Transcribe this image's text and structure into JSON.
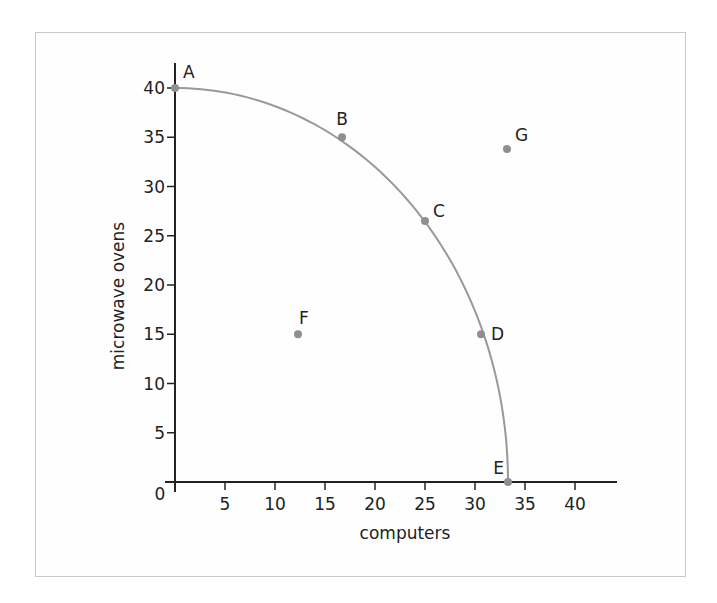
{
  "chart_data": {
    "type": "scatter",
    "title": "",
    "xlabel": "computers",
    "ylabel": "microwave ovens",
    "xlim": [
      0,
      44
    ],
    "ylim": [
      0,
      42
    ],
    "origin_label": "0",
    "x_ticks": [
      5,
      10,
      15,
      20,
      25,
      30,
      35,
      40
    ],
    "y_ticks": [
      5,
      10,
      15,
      20,
      25,
      30,
      35,
      40
    ],
    "grid": false,
    "legend": null,
    "curve": {
      "name": "production possibilities frontier",
      "description": "concave curve from (0,40) to (33.3,0)",
      "color": "#999999",
      "points": [
        {
          "x": 0,
          "y": 40
        },
        {
          "x": 16.7,
          "y": 35
        },
        {
          "x": 25,
          "y": 26.5
        },
        {
          "x": 30.6,
          "y": 15
        },
        {
          "x": 33.3,
          "y": 0
        }
      ]
    },
    "points": [
      {
        "label": "A",
        "x": 0,
        "y": 40,
        "on_curve": true
      },
      {
        "label": "B",
        "x": 16.7,
        "y": 35,
        "on_curve": true
      },
      {
        "label": "C",
        "x": 25,
        "y": 26.5,
        "on_curve": true
      },
      {
        "label": "D",
        "x": 30.6,
        "y": 15,
        "on_curve": true
      },
      {
        "label": "E",
        "x": 33.3,
        "y": 0,
        "on_curve": true
      },
      {
        "label": "F",
        "x": 12.3,
        "y": 15,
        "on_curve": false
      },
      {
        "label": "G",
        "x": 33.2,
        "y": 33.8,
        "on_curve": false
      }
    ],
    "colors": {
      "axis": "#222222",
      "curve": "#999999",
      "point": "#8f8f8f",
      "frame": "#c8c8c8"
    }
  }
}
